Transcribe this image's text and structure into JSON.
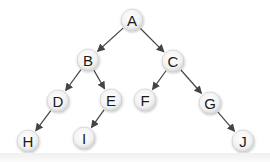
{
  "diagram": {
    "type": "binary-tree",
    "node_radius": 11,
    "colors": {
      "node_fill_center": "#ffffff",
      "node_fill_edge": "#d6d6d6",
      "node_stroke": "#c8c8c8",
      "edge": "#444444",
      "label": "#1a1a1a",
      "background": "#ffffff"
    },
    "nodes": [
      {
        "id": "A",
        "label": "A",
        "x": 132,
        "y": 20
      },
      {
        "id": "B",
        "label": "B",
        "x": 88,
        "y": 60
      },
      {
        "id": "C",
        "label": "C",
        "x": 173,
        "y": 61
      },
      {
        "id": "D",
        "label": "D",
        "x": 58,
        "y": 101
      },
      {
        "id": "E",
        "label": "E",
        "x": 111,
        "y": 100
      },
      {
        "id": "F",
        "label": "F",
        "x": 145,
        "y": 100
      },
      {
        "id": "G",
        "label": "G",
        "x": 210,
        "y": 103
      },
      {
        "id": "H",
        "label": "H",
        "x": 28,
        "y": 141
      },
      {
        "id": "I",
        "label": "I",
        "x": 84,
        "y": 138
      },
      {
        "id": "J",
        "label": "J",
        "x": 243,
        "y": 141
      }
    ],
    "edges": [
      {
        "from": "A",
        "to": "B"
      },
      {
        "from": "A",
        "to": "C"
      },
      {
        "from": "B",
        "to": "D"
      },
      {
        "from": "B",
        "to": "E"
      },
      {
        "from": "C",
        "to": "F"
      },
      {
        "from": "C",
        "to": "G"
      },
      {
        "from": "D",
        "to": "H"
      },
      {
        "from": "E",
        "to": "I"
      },
      {
        "from": "G",
        "to": "J"
      }
    ]
  }
}
